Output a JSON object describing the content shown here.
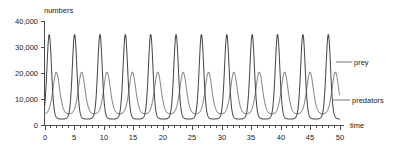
{
  "chart_data": {
    "type": "line",
    "title": "",
    "xlabel": "time",
    "ylabel": "numbers",
    "xlim": [
      0,
      50
    ],
    "ylim": [
      0,
      40000
    ],
    "grid": false,
    "legend_position": "right-inline-labels",
    "x_ticks": [
      0,
      5,
      10,
      15,
      20,
      25,
      30,
      35,
      40,
      45,
      50
    ],
    "x_tick_labels": [
      "0",
      "5",
      "10",
      "15",
      "20",
      "25",
      "30",
      "35",
      "40",
      "45",
      "50"
    ],
    "x_minor_tick_step": 1,
    "y_ticks": [
      0,
      10000,
      20000,
      30000,
      40000
    ],
    "y_tick_labels": [
      "0",
      "10,000",
      "20,000",
      "30,000",
      "40,000"
    ],
    "series": [
      {
        "name": "prey",
        "color": "#4a4a4a",
        "peak_value": 35000,
        "trough_value": 2500,
        "initial_value": 33000,
        "period": 4.3,
        "first_peak_x": 0.8,
        "num_peaks": 12
      },
      {
        "name": "predators",
        "color": "#8a8a8a",
        "peak_value": 20500,
        "trough_value": 4500,
        "initial_value": 5000,
        "period": 4.3,
        "first_peak_x": 2.0,
        "num_peaks": 12
      }
    ],
    "annotations": [
      {
        "text": "prey",
        "target_series": "prey"
      },
      {
        "text": "predators",
        "target_series": "predators"
      }
    ]
  },
  "axes": {
    "y_axis_title": "numbers",
    "x_axis_title": "time"
  },
  "labels": {
    "prey": "prey",
    "predators": "predators"
  },
  "y_tick_labels": {
    "t0": "0",
    "t1": "10,000",
    "t2": "20,000",
    "t3": "30,000",
    "t4": "40,000"
  },
  "x_tick_labels": {
    "t0": "0",
    "t1": "5",
    "t2": "10",
    "t3": "15",
    "t4": "20",
    "t5": "25",
    "t6": "30",
    "t7": "35",
    "t8": "40",
    "t9": "45",
    "t10": "50"
  },
  "colors": {
    "prey_stroke": "#4a4a4a",
    "predator_stroke": "#8a8a8a",
    "axis": "#4a4a4a",
    "text": "#222222",
    "background": "#ffffff"
  }
}
